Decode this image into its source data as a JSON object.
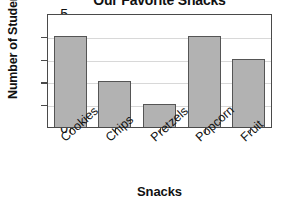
{
  "chart_data": {
    "type": "bar",
    "title": "Our Favorite Snacks",
    "xlabel": "Snacks",
    "ylabel": "Number of Students",
    "categories": [
      "Cookies",
      "Chips",
      "Pretzels",
      "Popcorn",
      "Fruit"
    ],
    "values": [
      4,
      2,
      1,
      4,
      3
    ],
    "ylim": [
      0,
      5
    ],
    "ytick_labels": [
      "5",
      "4",
      "3",
      "2",
      "1",
      "0"
    ],
    "ytick_values": [
      5,
      4,
      3,
      2,
      1,
      0
    ],
    "grid": true,
    "grid_axis": "y",
    "legend": false,
    "colors": {
      "bar_fill": "#b2b2b2",
      "bar_border": "#555555",
      "axis": "#4a4a4a",
      "gridline": "#d8d8d8",
      "background": "#ffffff",
      "text": "#111111"
    }
  }
}
